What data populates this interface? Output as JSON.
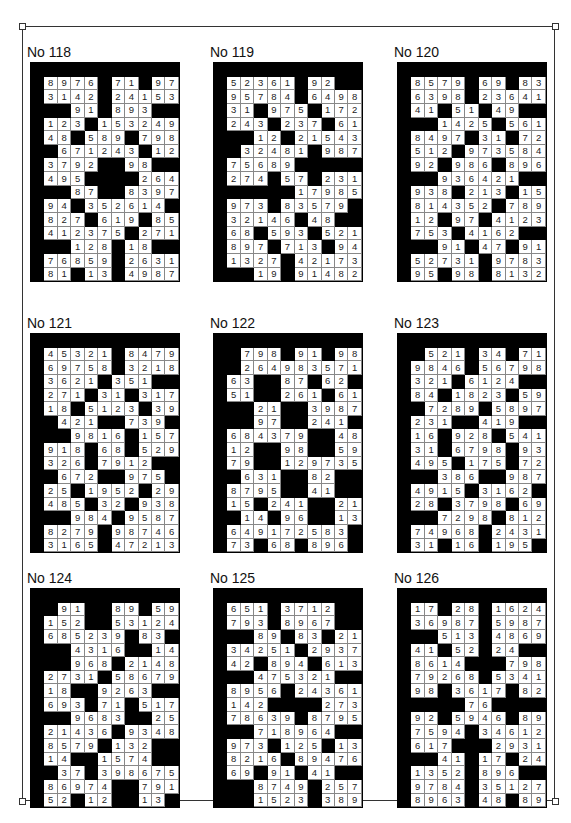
{
  "page": {
    "puzzles": [
      {
        "title": "No 118",
        "rows": [
          "8976_71_97",
          "3142_24153",
          "__91_893__",
          "123_153249",
          "48_589_798",
          "_671243_12",
          "3792__98__",
          "495____264",
          "__87__8397",
          "94_352614_",
          "827_619_85",
          "412375_271",
          "__128_18__",
          "76859_2631",
          "81_13_4987"
        ]
      },
      {
        "title": "No 119",
        "rows": [
          "52361_92__",
          "95784_6498",
          "31_975_172",
          "243_237_61",
          "__12_21543",
          "_32481_987",
          "75689_____",
          "274_57_231",
          "_____17985",
          "973_83579_",
          "32146_48__",
          "68_593_521",
          "897_713_94",
          "1327_42173",
          "__19_91482"
        ]
      },
      {
        "title": "No 120",
        "rows": [
          "8579_69_83",
          "6398_23641",
          "41_51_49__",
          "__1425_561",
          "8497_31_72",
          "512_973584",
          "92_986_896",
          "__936421__",
          "938_213_15",
          "814352_789",
          "12_97_4123",
          "753_4162__",
          "__91_47_91",
          "52731_9783",
          "95_98_8132"
        ]
      },
      {
        "title": "No 121",
        "rows": [
          "45321_8479",
          "69758_3218",
          "3621_351__",
          "271_31_317",
          "18_5123_39",
          "_421__739_",
          "__9816_157",
          "918_68_529",
          "326_7912__",
          "_672__975_",
          "25_1952_29",
          "485_32_938",
          "__984_9587",
          "8279_98746",
          "3165_47213"
        ]
      },
      {
        "title": "No 122",
        "rows": [
          "_798_91_98",
          "_264983571",
          "63__87_62_",
          "51__261_61",
          "__21__3987",
          "__97__241_",
          "684379__48",
          "12__98__59",
          "79__129735",
          "_631__82__",
          "8795__41__",
          "15_241__21",
          "_14_96__13",
          "649172583_",
          "73_68_896_"
        ]
      },
      {
        "title": "No 123",
        "rows": [
          "_521_34_71",
          "9846_56798",
          "321_6124__",
          "84_1823_59",
          "_7289_5897",
          "231__419__",
          "16_928_541",
          "31_6798_93",
          "495_175_72",
          "__386__987",
          "4915_3162_",
          "28_3798_69",
          "__7298_812",
          "74968_2431",
          "31_16_195_"
        ]
      },
      {
        "title": "No 124",
        "rows": [
          "_91__89_59",
          "152__53124",
          "685239_83_",
          "__4316__14",
          "__968_2148",
          "2731_58679",
          "18__9263__",
          "693_71_517",
          "__9683__25",
          "21436_9348",
          "8579_132__",
          "14__1574__",
          "_37_398675",
          "86974__791",
          "52_12__13_"
        ]
      },
      {
        "title": "No 125",
        "rows": [
          "651_3712__",
          "793_8967__",
          "__89_83_21",
          "34251_2937",
          "42_894_613",
          "__475321__",
          "8956_24361",
          "142____273",
          "78639_8795",
          "__718964__",
          "973_125_13",
          "8216_89476",
          "69_91_41__",
          "__8749_257",
          "__1523_389"
        ]
      },
      {
        "title": "No 126",
        "rows": [
          "17_28_1624",
          "36987_5987",
          "__513_4869",
          "41_52_24__",
          "8614___798",
          "79268_5341",
          "98_3617_82",
          "____76____",
          "92_5946_89",
          "7594_34612",
          "617___2931",
          "__41_17_24",
          "1352_896__",
          "9784_35127",
          "8963_48_89"
        ]
      }
    ]
  }
}
